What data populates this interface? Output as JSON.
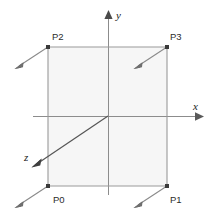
{
  "figure": {
    "background_color": "#ffffff"
  },
  "colors": {
    "axis": "#8c8c8c",
    "z_axis": "#555555",
    "quad_edge": "#9a9a9a",
    "quad_fill": "#f6f6f6",
    "normal_vector": "#8a8a8a",
    "corner_dot": "#3a3a3a",
    "label_text": "#2b2b2b",
    "axis_label_text": "#1a1a1a"
  },
  "axes": {
    "origin": {
      "x": 108,
      "y": 116
    },
    "x_axis": {
      "label": "x",
      "label_pos": {
        "x": 194,
        "y": 110
      },
      "start": {
        "x": 33,
        "y": 116
      },
      "end": {
        "x": 197,
        "y": 116
      },
      "arrow_tip": {
        "x": 204,
        "y": 116
      },
      "arrow_direction": "right"
    },
    "y_axis": {
      "label": "y",
      "label_pos": {
        "x": 116,
        "y": 19
      },
      "start": {
        "x": 108,
        "y": 195
      },
      "end": {
        "x": 108,
        "y": 17
      },
      "arrow_tip": {
        "x": 108,
        "y": 10
      },
      "arrow_direction": "up"
    },
    "z_axis": {
      "label": "z",
      "label_pos": {
        "x": 25,
        "y": 160
      },
      "start": {
        "x": 108,
        "y": 116
      },
      "end": {
        "x": 38,
        "y": 163
      },
      "arrow_tip": {
        "x": 32,
        "y": 167
      },
      "arrow_direction": "down-left"
    }
  },
  "quad": {
    "fill": "#f6f6f6",
    "stroke": "#9a9a9a",
    "corners": [
      {
        "id": "P0",
        "label": "P0",
        "x": 48,
        "y": 186,
        "label_x": 54,
        "label_y": 202,
        "normal_end_x": 17,
        "normal_end_y": 206
      },
      {
        "id": "P1",
        "label": "P1",
        "x": 167,
        "y": 186,
        "label_x": 171,
        "label_y": 202,
        "normal_end_x": 136,
        "normal_end_y": 206
      },
      {
        "id": "P2",
        "label": "P2",
        "x": 48,
        "y": 47,
        "label_x": 54,
        "label_y": 39,
        "normal_end_x": 17,
        "normal_end_y": 67
      },
      {
        "id": "P3",
        "label": "P3",
        "x": 167,
        "y": 47,
        "label_x": 171,
        "label_y": 39,
        "normal_end_x": 136,
        "normal_end_y": 67
      }
    ]
  },
  "normals": {
    "description": "Each corner emits a normal vector pointing down and to the left",
    "direction": "down-left",
    "count": 4
  }
}
